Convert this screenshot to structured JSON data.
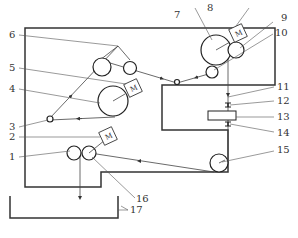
{
  "diagram": {
    "type": "mechanical schematic",
    "motor_label": "M",
    "labels": [
      {
        "id": "1",
        "text": "1"
      },
      {
        "id": "2",
        "text": "2"
      },
      {
        "id": "3",
        "text": "3"
      },
      {
        "id": "4",
        "text": "4"
      },
      {
        "id": "5",
        "text": "5"
      },
      {
        "id": "6",
        "text": "6"
      },
      {
        "id": "7",
        "text": "7"
      },
      {
        "id": "8",
        "text": "8"
      },
      {
        "id": "9",
        "text": "9"
      },
      {
        "id": "10",
        "text": "10"
      },
      {
        "id": "11",
        "text": "11"
      },
      {
        "id": "12",
        "text": "12"
      },
      {
        "id": "13",
        "text": "13"
      },
      {
        "id": "14",
        "text": "14"
      },
      {
        "id": "15",
        "text": "15"
      },
      {
        "id": "16",
        "text": "16"
      },
      {
        "id": "17",
        "text": "17"
      }
    ]
  }
}
